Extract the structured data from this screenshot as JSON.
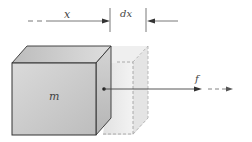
{
  "diagram": {
    "type": "physics-free-body",
    "labels": {
      "displacement": "x",
      "increment": "dx",
      "mass": "m",
      "force": "f"
    },
    "colors": {
      "line": "#333333",
      "block_front": "#c9c9c9",
      "block_top": "#d8d8d8",
      "block_side": "#b8b8b8",
      "ghost_fill": "#ececec",
      "ghost_edge": "#9a9a9a"
    }
  }
}
